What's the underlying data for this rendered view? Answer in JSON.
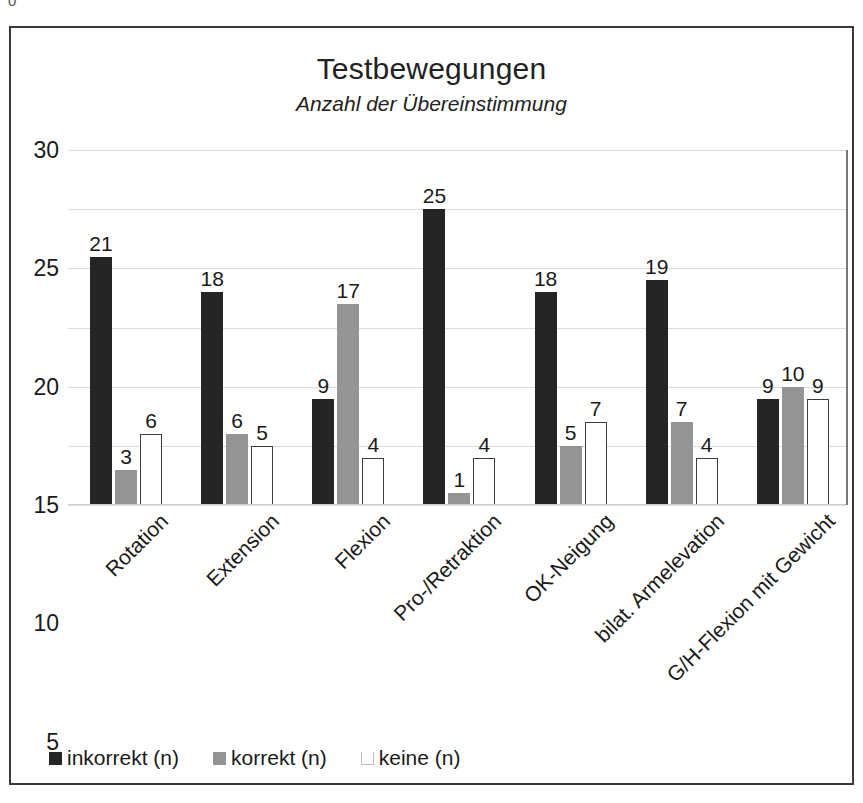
{
  "artifact": {
    "text": "0"
  },
  "chart_data": {
    "type": "bar",
    "title": "Testbewegungen",
    "subtitle": "Anzahl der Übereinstimmung",
    "xlabel": "",
    "ylabel": "",
    "ylim": [
      0,
      30
    ],
    "yticks": [
      0,
      5,
      10,
      15,
      20,
      25,
      30
    ],
    "ytick_labels": [
      "0",
      "5",
      "10",
      "15",
      "20",
      "25",
      "30"
    ],
    "grid": true,
    "legend_position": "bottom-left",
    "data_labels": true,
    "categories": [
      "Rotation",
      "Extension",
      "Flexion",
      "Pro-/Retraktion",
      "OK-Neigung",
      "bilat. Armelevation",
      "G/H-Flexion mit Gewicht"
    ],
    "series": [
      {
        "name": "inkorrekt (n)",
        "color": "#252525",
        "values": [
          21,
          18,
          9,
          25,
          18,
          19,
          9
        ]
      },
      {
        "name": "korrekt (n)",
        "color": "#949494",
        "values": [
          3,
          6,
          17,
          1,
          5,
          7,
          10
        ]
      },
      {
        "name": "keine (n)",
        "color": "#ffffff",
        "values": [
          6,
          5,
          4,
          4,
          7,
          4,
          9
        ]
      }
    ]
  }
}
